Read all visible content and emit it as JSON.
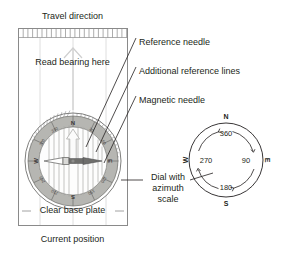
{
  "figure": {
    "background": "#ffffff",
    "ink": "#231f20"
  },
  "baseplate": {
    "name": "Clear base plate",
    "label_clear_base_plate": "Clear base plate",
    "label_travel_direction": "Travel direction",
    "label_read_bearing_here": "Read bearing here",
    "label_current_position": "Current position",
    "border_color": "#8a8a8a",
    "ruler_ticks": 23
  },
  "callouts": [
    {
      "key": "reference_needle",
      "label": "Reference needle"
    },
    {
      "key": "additional_reference_lines",
      "label": "Additional reference lines"
    },
    {
      "key": "magnetic_needle",
      "label": "Magnetic needle"
    },
    {
      "key": "dial_azimuth_scale",
      "label_line1": "Dial with",
      "label_line2": "azimuth",
      "label_line3": "scale"
    }
  ],
  "compass_dial": {
    "cardinals": [
      "N",
      "E",
      "S",
      "W"
    ],
    "degree_labels": [
      "30",
      "60",
      "120",
      "150",
      "210",
      "240",
      "300",
      "330"
    ],
    "ring_fill": "#b8b8b4",
    "ring_stroke": "#7d7d7a",
    "needle_north_color": "#ffffff",
    "needle_south_color": "#6e6e6c",
    "reference_lines_count": 11
  },
  "azimuth_scale": {
    "cardinals": {
      "north": "N",
      "east": "E",
      "south": "S",
      "west": "W"
    },
    "degrees": {
      "north": "360",
      "east": "90",
      "south": "180",
      "west": "270"
    },
    "direction": "clockwise"
  }
}
